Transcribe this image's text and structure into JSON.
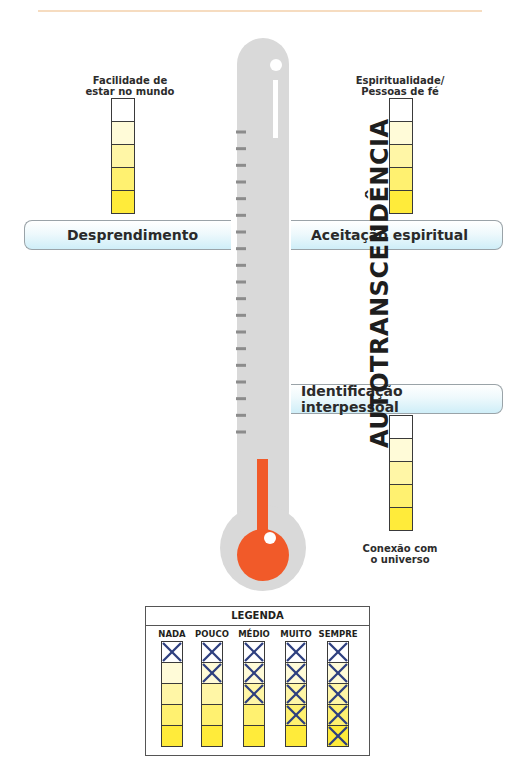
{
  "diagram": {
    "thermometer_label": "AUTOTRANSCENDÊNCIA",
    "thermometer_tick_count": 19,
    "colors": {
      "thermometer_body": "#d9d9d9",
      "mercury": "#f15a29",
      "tick": "#8c8c8c",
      "band_tint": "#cfeef8",
      "scale_levels": [
        "#ffffff",
        "#fffbd8",
        "#fff6a6",
        "#fff170",
        "#ffeb3a"
      ],
      "cross": "#2e3f7f",
      "top_rule": "#f6dcc0"
    },
    "bands": [
      {
        "id": "desprendimento",
        "label": "Desprendimento",
        "side": "left"
      },
      {
        "id": "aceitacao",
        "label": "Aceitação espiritual",
        "side": "right"
      },
      {
        "id": "identificacao",
        "label": "Identificação interpessoal",
        "side": "right"
      }
    ],
    "scales": [
      {
        "id": "facilidade",
        "caption_line1": "Facilidade de",
        "caption_line2": "estar no mundo",
        "levels": 5
      },
      {
        "id": "espiritualidade",
        "caption_line1": "Espiritualidade/",
        "caption_line2": "Pessoas de fé",
        "levels": 5
      },
      {
        "id": "conexao",
        "caption_line1": "Conexão com",
        "caption_line2": "o universo",
        "levels": 5
      }
    ]
  },
  "legend": {
    "title": "LEGENDA",
    "columns": [
      {
        "label": "NADA",
        "crossed": 1
      },
      {
        "label": "POUCO",
        "crossed": 2
      },
      {
        "label": "MÉDIO",
        "crossed": 3
      },
      {
        "label": "MUITO",
        "crossed": 4
      },
      {
        "label": "SEMPRE",
        "crossed": 5
      }
    ]
  }
}
